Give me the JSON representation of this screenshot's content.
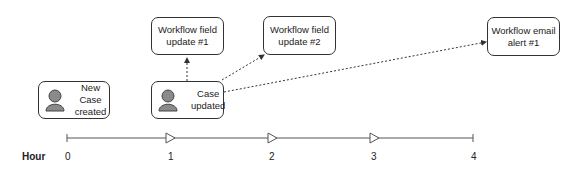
{
  "events": [
    {
      "id": "new-case",
      "label": "New Case\ncreated",
      "icon": "user-icon"
    },
    {
      "id": "case-updated",
      "label": "Case\nupdated",
      "icon": "user-icon"
    }
  ],
  "actions": [
    {
      "id": "wf-field-1",
      "label": "Workflow field\nupdate #1"
    },
    {
      "id": "wf-field-2",
      "label": "Workflow field\nupdate #2"
    },
    {
      "id": "wf-email-1",
      "label": "Workflow email\nalert #1"
    }
  ],
  "timeline": {
    "axis_label": "Hour",
    "ticks": [
      "0",
      "1",
      "2",
      "3",
      "4"
    ]
  },
  "colors": {
    "line": "#333333",
    "icon": "#8a8a8a"
  }
}
